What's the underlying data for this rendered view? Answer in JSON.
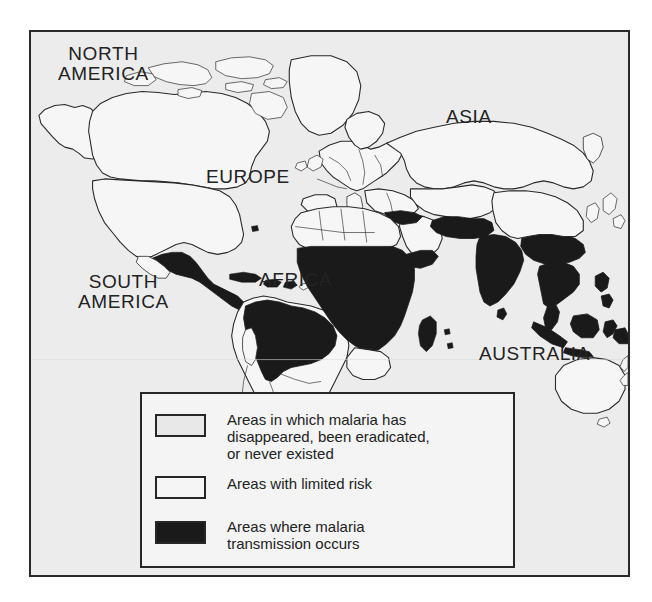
{
  "figure": {
    "kind": "thematic-world-map",
    "background_color": "#ececec",
    "frame_color": "#2a2a2a",
    "coastline_color": "#2a2a2a"
  },
  "map": {
    "labels": [
      {
        "id": "north-america",
        "text": "NORTH\nAMERICA"
      },
      {
        "id": "south-america",
        "text": "SOUTH\nAMERICA"
      },
      {
        "id": "europe",
        "text": "EUROPE"
      },
      {
        "id": "africa",
        "text": "AFRICA"
      },
      {
        "id": "asia",
        "text": "ASIA"
      },
      {
        "id": "australia",
        "text": "AUSTRALIA"
      }
    ],
    "categories": {
      "none": {
        "color": "#ececec",
        "meaning": "disappeared, eradicated, or never existed"
      },
      "limited": {
        "color": "#f6f6f6",
        "meaning": "limited risk"
      },
      "transmission": {
        "color": "#1a1a1a",
        "meaning": "malaria transmission occurs"
      }
    },
    "transmission_regions": [
      "Central America",
      "Amazon Basin / northern South America",
      "Sub-Saharan Africa",
      "Madagascar",
      "Arabian Peninsula margins",
      "Indian subcontinent",
      "Mainland Southeast Asia",
      "Indonesia",
      "Philippines",
      "New Guinea"
    ]
  },
  "legend": {
    "items": [
      {
        "id": "none",
        "swatch_color": "#e8e8e8",
        "label": "Areas in which malaria has\ndisappeared, been eradicated,\nor never existed"
      },
      {
        "id": "limited",
        "swatch_color": "#f5f5f5",
        "label": "Areas with limited risk"
      },
      {
        "id": "transmission",
        "swatch_color": "#1a1a1a",
        "label": "Areas where malaria\ntransmission occurs"
      }
    ]
  }
}
